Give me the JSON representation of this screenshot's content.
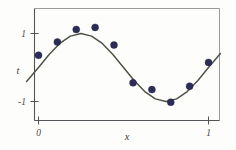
{
  "figure": {
    "name": "curve-fitting-sine-plot",
    "background_color": "#fdfdfc"
  },
  "chart_data": {
    "type": "scatter",
    "title": "",
    "subtitle": "",
    "xlabel": "x",
    "ylabel": "t",
    "xlim": [
      -0.07,
      1.07
    ],
    "ylim": [
      -1.32,
      1.38
    ],
    "grid": false,
    "legend": null,
    "xticks": [
      0,
      1
    ],
    "xticklabels": [
      "0",
      "1"
    ],
    "yticks": [
      -1,
      1
    ],
    "yticklabels": [
      "-1",
      "1"
    ],
    "point_color": "#2c2c58",
    "curve_color": "#4c5243",
    "axis_color": "#555258",
    "series": [
      {
        "name": "observed-data",
        "type": "scatter",
        "marker": "circle",
        "color": "#2c2c58",
        "x": [
          0.0,
          0.111,
          0.222,
          0.333,
          0.444,
          0.556,
          0.667,
          0.778,
          0.889,
          1.0
        ],
        "y": [
          0.36,
          0.75,
          1.12,
          1.18,
          0.66,
          -0.45,
          -0.65,
          -1.02,
          -0.55,
          0.15
        ]
      },
      {
        "name": "true-sine-curve",
        "type": "line",
        "color": "#4c5243",
        "function": "sin(2*pi*x)",
        "x": [
          -0.07,
          0.0,
          0.0625,
          0.125,
          0.1875,
          0.25,
          0.3125,
          0.375,
          0.4375,
          0.5,
          0.5625,
          0.625,
          0.6875,
          0.75,
          0.8125,
          0.875,
          0.9375,
          1.0,
          1.07
        ],
        "y": [
          -0.41,
          0.0,
          0.383,
          0.707,
          0.924,
          1.0,
          0.924,
          0.707,
          0.383,
          0.0,
          -0.383,
          -0.707,
          -0.924,
          -1.0,
          -0.924,
          -0.707,
          -0.383,
          0.0,
          0.41
        ]
      }
    ]
  }
}
